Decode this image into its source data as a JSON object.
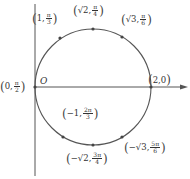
{
  "diagram": {
    "type": "polar-circle",
    "origin_label": "O",
    "circle": {
      "center_px": [
        93,
        87
      ],
      "radius_px": 58,
      "stroke": "#555555"
    },
    "axis_color": "#555555",
    "points": [
      {
        "id": "p1",
        "r": "1",
        "theta_num": "π",
        "theta_den": "3",
        "x": 60,
        "y": 38,
        "lx": 32,
        "ly": 12
      },
      {
        "id": "p2",
        "r": "√2",
        "theta_num": "π",
        "theta_den": "4",
        "x": 93,
        "y": 29,
        "lx": 73,
        "ly": 4
      },
      {
        "id": "p3",
        "r": "√3",
        "theta_num": "π",
        "theta_den": "6",
        "x": 122,
        "y": 37,
        "lx": 121,
        "ly": 13
      },
      {
        "id": "p4",
        "r": "2",
        "theta": "0",
        "x": 151,
        "y": 87,
        "lx": 148,
        "ly": 74
      },
      {
        "id": "p5",
        "r": "0",
        "theta_num": "π",
        "theta_den": "2",
        "x": 35,
        "y": 87,
        "lx": 0,
        "ly": 80
      },
      {
        "id": "p6",
        "r": "−1",
        "theta_num": "2π",
        "theta_den": "3",
        "x": 63,
        "y": 137,
        "lx": 62,
        "ly": 107
      },
      {
        "id": "p7",
        "r": "−√2",
        "theta_num": "3π",
        "theta_den": "4",
        "x": 93,
        "y": 145,
        "lx": 66,
        "ly": 152
      },
      {
        "id": "p8",
        "r": "−√3",
        "theta_num": "5π",
        "theta_den": "6",
        "x": 122,
        "y": 137,
        "lx": 124,
        "ly": 141
      }
    ]
  }
}
